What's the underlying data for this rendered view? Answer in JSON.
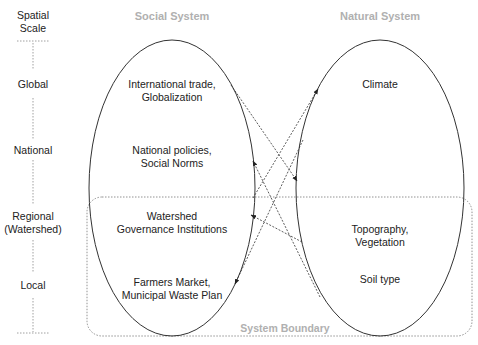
{
  "scale_axis": {
    "title": "Spatial\nScale",
    "levels": [
      "Global",
      "National",
      "Regional\n(Watershed)",
      "Local"
    ]
  },
  "social_system": {
    "title": "Social System",
    "items": [
      "International trade,\nGlobalization",
      "National policies,\nSocial Norms",
      "Watershed\nGovernance Institutions",
      "Farmers Market,\nMunicipal Waste Plan"
    ]
  },
  "natural_system": {
    "title": "Natural System",
    "items": [
      "Climate",
      "Topography,\nVegetation",
      "Soil type"
    ]
  },
  "system_boundary": {
    "label": "System Boundary"
  },
  "arrows": [
    {
      "from": "International trade, Globalization",
      "to": "Natural System (National level)"
    },
    {
      "from": "Watershed Governance Institutions",
      "to": "Climate"
    },
    {
      "from": "Natural System (National level)",
      "to": "Farmers Market, Municipal Waste Plan"
    },
    {
      "from": "Soil type",
      "to": "National policies, Social Norms"
    },
    {
      "from": "Topography, Vegetation",
      "to": "Watershed Governance Institutions"
    }
  ],
  "colors": {
    "line": "#333333",
    "header": "#b0b0b0",
    "boundary": "#777777"
  }
}
